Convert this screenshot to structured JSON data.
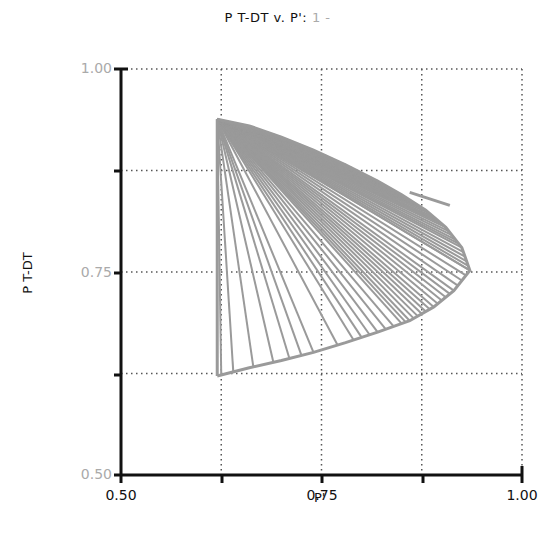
{
  "chart_data": {
    "type": "line",
    "title": "P T-DT v. P': 1 -",
    "title_main": "P T-DT v. P':",
    "title_suffix": "1 -",
    "xlabel": "P'",
    "ylabel": "P T-DT",
    "xlim": [
      0.5,
      1.0
    ],
    "ylim": [
      0.5,
      1.0
    ],
    "xticks": [
      "0.50",
      "0.75",
      "1.00"
    ],
    "yticks": [
      "0.50",
      "0.75",
      "1.00"
    ],
    "grid": true,
    "grid_values_x": [
      0.625,
      0.75,
      0.875,
      1.0
    ],
    "grid_values_y": [
      0.625,
      0.75,
      0.875,
      1.0
    ],
    "line_color": "#9a9a9a",
    "origin_point": {
      "x": 0.62,
      "y": 0.938
    },
    "vertical_segment": {
      "x": 0.62,
      "y_from": 0.938,
      "y_to": 0.622
    },
    "lower_envelope": [
      {
        "x": 0.62,
        "y": 0.622
      },
      {
        "x": 0.66,
        "y": 0.632
      },
      {
        "x": 0.7,
        "y": 0.641
      },
      {
        "x": 0.74,
        "y": 0.651
      },
      {
        "x": 0.78,
        "y": 0.663
      },
      {
        "x": 0.82,
        "y": 0.676
      },
      {
        "x": 0.86,
        "y": 0.69
      },
      {
        "x": 0.89,
        "y": 0.707
      },
      {
        "x": 0.915,
        "y": 0.727
      },
      {
        "x": 0.935,
        "y": 0.752
      },
      {
        "x": 0.925,
        "y": 0.78
      },
      {
        "x": 0.905,
        "y": 0.805
      },
      {
        "x": 0.88,
        "y": 0.826
      },
      {
        "x": 0.85,
        "y": 0.845
      },
      {
        "x": 0.82,
        "y": 0.862
      },
      {
        "x": 0.78,
        "y": 0.882
      },
      {
        "x": 0.74,
        "y": 0.9
      },
      {
        "x": 0.7,
        "y": 0.916
      },
      {
        "x": 0.66,
        "y": 0.93
      }
    ],
    "fan_targets_x_on_lower_curve": [
      0.625,
      0.64,
      0.665,
      0.69,
      0.71,
      0.725,
      0.74,
      0.77,
      0.79,
      0.8,
      0.81,
      0.82,
      0.83,
      0.84,
      0.85,
      0.855,
      0.86,
      0.865,
      0.87,
      0.875,
      0.88,
      0.885,
      0.89,
      0.895,
      0.9,
      0.905,
      0.91,
      0.915,
      0.92,
      0.925,
      0.93,
      0.935
    ],
    "upper_stub": {
      "x_from": 0.86,
      "y_from": 0.848,
      "x_to": 0.91,
      "y_to": 0.832
    }
  }
}
